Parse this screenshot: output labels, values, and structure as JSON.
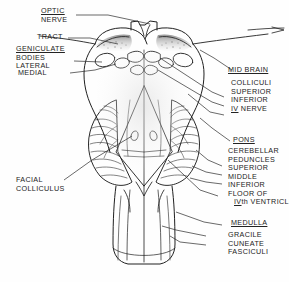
{
  "figure": {
    "ink_color": "#202020",
    "paper_color": "#fefefe",
    "shade_color": "#9a9a9a"
  },
  "labels_left": {
    "optic_nerve": {
      "line1": "OPTIC",
      "line2": "NERVE"
    },
    "tract": {
      "line1": "TRACT"
    },
    "geniculate": {
      "line1": "GENICULATE",
      "line2": "BODIES",
      "line3": "LATERAL",
      "line4": "MEDIAL"
    },
    "facial_colliculus": {
      "line1": "FACIAL",
      "line2": "COLLICULUS"
    }
  },
  "labels_right": {
    "midbrain": {
      "heading": "MID BRAIN",
      "lines": [
        "COLLICULI",
        "SUPERIOR",
        "INFERIOR"
      ],
      "nerve_numeral": "IV",
      "nerve_word": " NERVE"
    },
    "pons": {
      "heading": "PONS",
      "lines": [
        "CEREBELLAR",
        "PEDUNCLES",
        "SUPERIOR",
        "MIDDLE",
        "INFERIOR",
        "FLOOR OF"
      ],
      "ventricle_numeral": "IV",
      "ventricle_suffix": "th VENTRICLE"
    },
    "medulla": {
      "heading": "MEDULLA",
      "lines": [
        "GRACILE",
        "CUNEATE",
        "FASCICULI"
      ]
    }
  }
}
